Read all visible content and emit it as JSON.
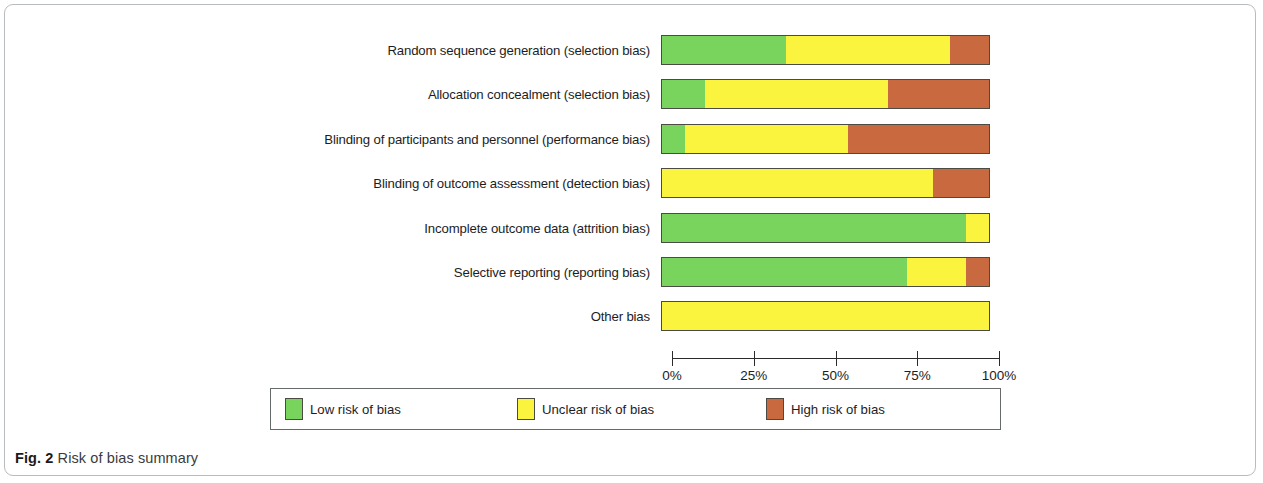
{
  "figure": {
    "caption_prefix": "Fig. 2",
    "caption_text": "Risk of bias summary"
  },
  "chart_data": {
    "type": "bar",
    "orientation": "horizontal",
    "stacked": true,
    "stack_mode": "percent",
    "title": "Risk of bias summary",
    "xlabel": "",
    "ylabel": "",
    "xlim": [
      0,
      100
    ],
    "grid": false,
    "legend_position": "bottom",
    "x_tick_labels": [
      "0%",
      "25%",
      "50%",
      "75%",
      "100%"
    ],
    "x_ticks": [
      0,
      25,
      50,
      75,
      100
    ],
    "categories": [
      "Random sequence generation (selection bias)",
      "Allocation concealment (selection bias)",
      "Blinding of participants and personnel (performance bias)",
      "Blinding of outcome assessment (detection bias)",
      "Incomplete outcome data (attrition bias)",
      "Selective reporting (reporting bias)",
      "Other bias"
    ],
    "series": [
      {
        "name": "Low risk of bias",
        "color": "#79d45d",
        "values": [
          38,
          13,
          7,
          0,
          93,
          75,
          0
        ]
      },
      {
        "name": "Unclear risk of bias",
        "color": "#fbf43e",
        "values": [
          50,
          56,
          50,
          83,
          7,
          18,
          100
        ]
      },
      {
        "name": "High risk of bias",
        "color": "#c8693f",
        "values": [
          12,
          31,
          43,
          17,
          0,
          7,
          0
        ]
      }
    ]
  },
  "legend": {
    "items": [
      {
        "label": "Low risk of bias",
        "color": "#79d45d"
      },
      {
        "label": "Unclear risk of bias",
        "color": "#fbf43e"
      },
      {
        "label": "High risk of bias",
        "color": "#c8693f"
      }
    ]
  }
}
